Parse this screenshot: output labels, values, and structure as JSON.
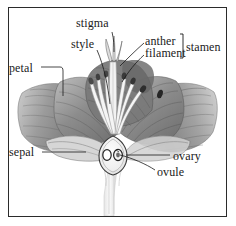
{
  "figure": {
    "kind": "botanical-flower-cross-section-diagram",
    "frame_color": "#2b2b2b",
    "background_color": "#ffffff",
    "ink_color": "#1a1a1a"
  },
  "labels": {
    "stigma": "stigma",
    "style": "style",
    "anther": "anther",
    "filament": "filament",
    "stamen": "stamen",
    "petal": "petal",
    "sepal": "sepal",
    "ovary": "ovary",
    "ovule": "ovule"
  }
}
